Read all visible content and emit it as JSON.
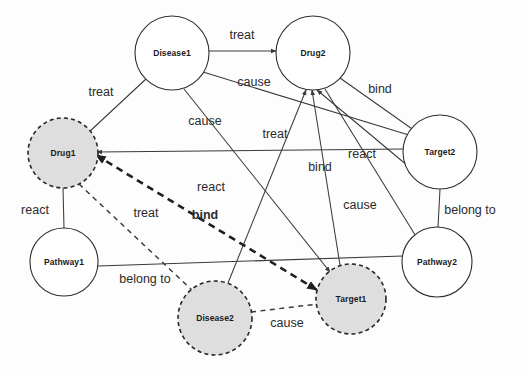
{
  "diagram": {
    "background_color": "#fdfdfd",
    "node_fill_solid": "#ffffff",
    "node_fill_dashed": "#dedede",
    "edge_color": "#3a3a3a"
  },
  "nodes": [
    {
      "id": "disease1",
      "label": "Disease1",
      "cx": 172,
      "cy": 53,
      "r": 37,
      "style": "solid"
    },
    {
      "id": "drug2",
      "label": "Drug2",
      "cx": 313,
      "cy": 53,
      "r": 37,
      "style": "solid"
    },
    {
      "id": "drug1",
      "label": "Drug1",
      "cx": 63,
      "cy": 153,
      "r": 35,
      "style": "dashed"
    },
    {
      "id": "target2",
      "label": "Target2",
      "cx": 440,
      "cy": 152,
      "r": 37,
      "style": "solid"
    },
    {
      "id": "pathway1",
      "label": "Pathway1",
      "cx": 64,
      "cy": 262,
      "r": 34,
      "style": "solid"
    },
    {
      "id": "pathway2",
      "label": "Pathway2",
      "cx": 437,
      "cy": 262,
      "r": 35,
      "style": "solid"
    },
    {
      "id": "target1",
      "label": "Target1",
      "cx": 351,
      "cy": 299,
      "r": 35,
      "style": "dashed"
    },
    {
      "id": "disease2",
      "label": "Disease2",
      "cx": 215,
      "cy": 318,
      "r": 37,
      "style": "dashed"
    }
  ],
  "edges": [
    {
      "id": "e1",
      "label": "treat",
      "source": "disease1",
      "target": "drug2",
      "style": "solid",
      "x1": 209,
      "y1": 51,
      "x2": 276,
      "y2": 51,
      "lx": 242,
      "ly": 36
    },
    {
      "id": "e2",
      "label": "treat",
      "source": "drug1",
      "target": "disease1",
      "style": "solid",
      "x1": 88,
      "y1": 133,
      "x2": 146,
      "y2": 79,
      "lx": 101,
      "ly": 93
    },
    {
      "id": "e3",
      "label": "cause",
      "source": "disease1",
      "target": "target2",
      "style": "solid",
      "x1": 203,
      "y1": 72,
      "x2": 412,
      "y2": 136,
      "lx": 254,
      "ly": 83
    },
    {
      "id": "e4",
      "label": "bind",
      "source": "drug2",
      "target": "target2",
      "style": "solid",
      "x1": 340,
      "y1": 78,
      "x2": 415,
      "y2": 131,
      "lx": 380,
      "ly": 90
    },
    {
      "id": "e5",
      "label": "cause",
      "source": "disease1",
      "target": "target1",
      "style": "solid",
      "x1": 184,
      "y1": 89,
      "x2": 330,
      "y2": 272,
      "lx": 205,
      "ly": 122
    },
    {
      "id": "e6",
      "label": "treat",
      "source": "disease2",
      "target": "drug2",
      "style": "solid",
      "x1": 228,
      "y1": 283,
      "x2": 306,
      "y2": 90,
      "lx": 275,
      "ly": 135
    },
    {
      "id": "e7",
      "label": "bind",
      "source": "target1",
      "target": "drug2",
      "style": "solid",
      "x1": 340,
      "y1": 265,
      "x2": 312,
      "y2": 90,
      "lx": 320,
      "ly": 168
    },
    {
      "id": "e8",
      "label": "react",
      "source": "target2",
      "target": "drug2",
      "style": "solid",
      "x1": 414,
      "y1": 171,
      "x2": 317,
      "y2": 90,
      "lx": 362,
      "ly": 155
    },
    {
      "id": "e9",
      "label": "react",
      "source": "target2",
      "target": "drug1",
      "style": "solid",
      "x1": 403,
      "y1": 149,
      "x2": 97,
      "y2": 152,
      "lx": 211,
      "ly": 188
    },
    {
      "id": "e10",
      "label": "cause",
      "source": "drug2",
      "target": "pathway2",
      "style": "solid",
      "x1": 325,
      "y1": 89,
      "x2": 417,
      "y2": 238,
      "lx": 360,
      "ly": 206
    },
    {
      "id": "e11",
      "label": "belong to",
      "source": "target2",
      "target": "pathway2",
      "style": "solid",
      "x1": 440,
      "y1": 189,
      "x2": 438,
      "y2": 227,
      "lx": 470,
      "ly": 211
    },
    {
      "id": "e12",
      "label": "react",
      "source": "drug1",
      "target": "pathway1",
      "style": "solid",
      "x1": 63,
      "y1": 188,
      "x2": 64,
      "y2": 228,
      "lx": 35,
      "ly": 211
    },
    {
      "id": "e13",
      "label": "belong to",
      "source": "pathway1",
      "target": "pathway2",
      "style": "solid",
      "x1": 98,
      "y1": 266,
      "x2": 403,
      "y2": 256,
      "lx": 145,
      "ly": 280
    },
    {
      "id": "e14",
      "label": "bind",
      "source": "drug1",
      "target": "target1",
      "style": "thick-dashed",
      "x1": 96,
      "y1": 155,
      "x2": 317,
      "y2": 290,
      "lx": 205,
      "ly": 216
    },
    {
      "id": "e15",
      "label": "treat",
      "source": "drug1",
      "target": "disease2",
      "style": "thin-dashed",
      "x1": 79,
      "y1": 184,
      "x2": 193,
      "y2": 291,
      "lx": 146,
      "ly": 214
    },
    {
      "id": "e16",
      "label": "cause",
      "source": "disease2",
      "target": "target1",
      "style": "thin-dashed",
      "x1": 251,
      "y1": 312,
      "x2": 318,
      "y2": 304,
      "lx": 287,
      "ly": 324
    }
  ],
  "legend": {
    "solid_node_meaning": "existing entity",
    "dashed_node_meaning": "predicted entity",
    "thick_dashed_edge_meaning": "predicted relation"
  }
}
